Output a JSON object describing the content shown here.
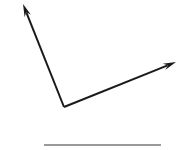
{
  "canvas": {
    "width": 183,
    "height": 150,
    "background_color": "#ffffff",
    "title": ""
  },
  "figure": {
    "type": "angle-diagram",
    "vertex": {
      "x": 64,
      "y": 107
    },
    "stroke_color": "#1a1a1a",
    "stroke_width": 2
  },
  "rays": [
    {
      "name": "upper-left-ray",
      "from": {
        "x": 64,
        "y": 107
      },
      "to": {
        "x": 23,
        "y": 4
      },
      "arrowhead": true,
      "color": "#1a1a1a",
      "width": 2
    },
    {
      "name": "upper-right-ray",
      "from": {
        "x": 64,
        "y": 107
      },
      "to": {
        "x": 176,
        "y": 62
      },
      "arrowhead": true,
      "color": "#1a1a1a",
      "width": 2
    }
  ],
  "baseline": {
    "name": "horizontal-rule",
    "from": {
      "x": 44,
      "y": 145
    },
    "to": {
      "x": 161,
      "y": 145
    },
    "color": "#9a9a9a",
    "width": 2
  },
  "labels": []
}
